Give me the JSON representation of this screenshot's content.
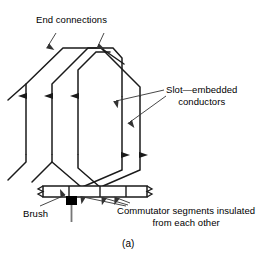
{
  "figure": {
    "caption": "(a)",
    "labels": {
      "end_connections": "End connections",
      "slot_embedded_conductors_line1": "Slot—embedded",
      "slot_embedded_conductors_line2": "conductors",
      "brush": "Brush",
      "commutator_line1": "Commutator segments insulated",
      "commutator_line2": "from each other"
    },
    "colors": {
      "stroke": "#1a1a1a",
      "leader": "#444444",
      "background": "#ffffff",
      "brush_fill": "#000000"
    },
    "winding": {
      "conductor_count": 6,
      "current_direction_left": "up",
      "current_direction_right": "down",
      "commutator_segment_count": 4
    }
  }
}
